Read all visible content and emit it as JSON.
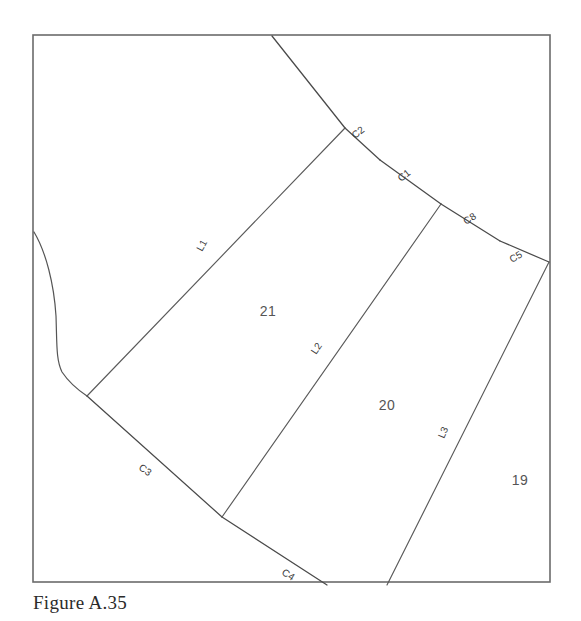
{
  "figure": {
    "caption": "Figure A.35",
    "frame": {
      "x": 33,
      "y": 35,
      "width": 517,
      "height": 547
    },
    "canvas": {
      "width": 581,
      "height": 621
    },
    "colors": {
      "background": "#ffffff",
      "frame_stroke": "#6b6b6b",
      "line_stroke": "#4a4a4a",
      "label_text": "#3b3b3b",
      "parcel_text": "#555555",
      "caption_text": "#2b2b2b"
    }
  },
  "diagram": {
    "type": "cadastral-plat-survey",
    "parcels": [
      {
        "id": "parcel-21",
        "label": "21",
        "x": 268,
        "y": 316
      },
      {
        "id": "parcel-20",
        "label": "20",
        "x": 387,
        "y": 410
      },
      {
        "id": "parcel-19",
        "label": "19",
        "x": 520,
        "y": 485
      }
    ],
    "boundary_courses": [
      {
        "id": "C2",
        "label": "C2",
        "lx": 355,
        "ly": 139,
        "rotation": -38,
        "from": [
          345,
          128
        ],
        "to": [
          380,
          160
        ]
      },
      {
        "id": "C1",
        "label": "C1",
        "lx": 401,
        "ly": 182,
        "rotation": -38,
        "from": [
          380,
          160
        ],
        "to": [
          441,
          204
        ]
      },
      {
        "id": "C8",
        "label": "C8",
        "lx": 466,
        "ly": 225,
        "rotation": -33,
        "from": [
          441,
          204
        ],
        "to": [
          500,
          241
        ]
      },
      {
        "id": "C5",
        "label": "C5",
        "lx": 519,
        "ly": 262,
        "rotation": -31,
        "from": [
          500,
          241
        ],
        "to": [
          549,
          262
        ]
      },
      {
        "id": "C3",
        "label": "C3",
        "lx": 146,
        "ly": 467,
        "rotation": 35,
        "from": [
          87,
          396
        ],
        "to": [
          222,
          517
        ]
      },
      {
        "id": "C4",
        "label": "C4",
        "lx": 288,
        "ly": 572,
        "rotation": 33,
        "from": [
          222,
          517
        ],
        "to": [
          327,
          585
        ]
      }
    ],
    "interior_lot_lines": [
      {
        "id": "L1",
        "label": "L1",
        "lx": 208,
        "ly": 250,
        "rotation": -61,
        "from": [
          87,
          396
        ],
        "to": [
          345,
          128
        ]
      },
      {
        "id": "L2",
        "label": "L2",
        "lx": 322,
        "ly": 353,
        "rotation": -56,
        "from": [
          222,
          517
        ],
        "to": [
          441,
          204
        ]
      },
      {
        "id": "L3",
        "label": "L3",
        "lx": 450,
        "ly": 437,
        "rotation": -67,
        "from": [
          387,
          585
        ],
        "to": [
          549,
          262
        ]
      }
    ],
    "upper_line": {
      "id": "top-boundary-segment",
      "from": [
        272,
        36
      ],
      "to": [
        345,
        128
      ]
    },
    "creek": {
      "id": "creek-curve",
      "points": "34,232 44,248 52,272 56,300 57,330 56,352 62,370 74,384 87,396"
    }
  }
}
